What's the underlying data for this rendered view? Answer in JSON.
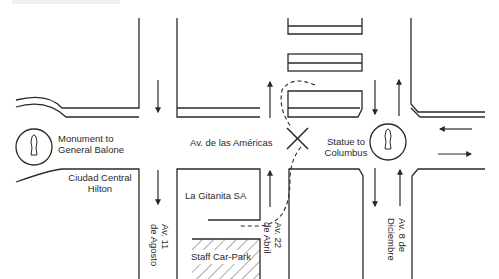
{
  "map": {
    "colors": {
      "line": "#2a2a2a",
      "background": "#ffffff",
      "text": "#2a2a2a"
    },
    "streets": {
      "main_avenue": "Av. de las Américas",
      "av_11": [
        "Av. 11",
        "de Agosto"
      ],
      "av_22": [
        "Av. 22",
        "de Abril"
      ],
      "av_8": [
        "Av. 8 de",
        "Diciembre"
      ]
    },
    "landmarks": {
      "monument": [
        "Monument to",
        "General Balone"
      ],
      "hotel": [
        "Ciudad Central",
        "Hilton"
      ],
      "statue": [
        "Statue to",
        "Columbus"
      ],
      "shop": "La Gitanita SA",
      "car_park": "Staff Car-Park"
    },
    "icons": {
      "monument_marker": "statue-in-circle-icon",
      "statue_marker": "statue-in-circle-icon",
      "destination_marker": "x-cross-icon",
      "route": "dashed-route-line",
      "traffic_arrows": "one-way-arrow-icon"
    }
  }
}
